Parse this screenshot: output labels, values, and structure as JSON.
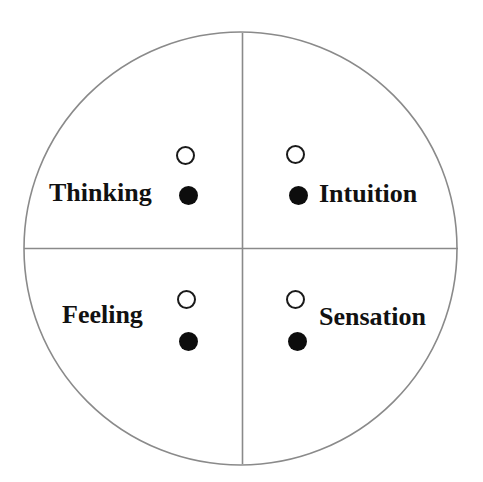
{
  "diagram": {
    "canvas": {
      "width": 483,
      "height": 482,
      "background": "#ffffff"
    },
    "outer_circle": {
      "name": "psyche-circle",
      "center_x": 240.5,
      "center_y": 248.5,
      "radius": 216.5,
      "stroke_color": "#8a8a8a",
      "stroke_width": 1.6,
      "fill": "none"
    },
    "dividers": {
      "vertical": {
        "name": "vertical-axis",
        "x": 242.5,
        "y1": 33,
        "y2": 464,
        "stroke_color": "#8a8a8a",
        "stroke_width": 1.6
      },
      "horizontal": {
        "name": "horizontal-axis",
        "y": 248.5,
        "x1": 24,
        "x2": 458,
        "stroke_color": "#8a8a8a",
        "stroke_width": 1.6
      }
    },
    "quadrants": [
      {
        "id": "thinking",
        "label": "Thinking",
        "position": "upper-left",
        "label_side": "left",
        "markers": [
          {
            "style": "open",
            "name": "thinking-open-circle"
          },
          {
            "style": "filled",
            "name": "thinking-filled-circle"
          }
        ]
      },
      {
        "id": "intuition",
        "label": "Intuition",
        "position": "upper-right",
        "label_side": "right",
        "markers": [
          {
            "style": "open",
            "name": "intuition-open-circle"
          },
          {
            "style": "filled",
            "name": "intuition-filled-circle"
          }
        ]
      },
      {
        "id": "feeling",
        "label": "Feeling",
        "position": "lower-left",
        "label_side": "left",
        "markers": [
          {
            "style": "open",
            "name": "feeling-open-circle"
          },
          {
            "style": "filled",
            "name": "feeling-filled-circle"
          }
        ]
      },
      {
        "id": "sensation",
        "label": "Sensation",
        "position": "lower-right",
        "label_side": "right",
        "markers": [
          {
            "style": "open",
            "name": "sensation-open-circle"
          },
          {
            "style": "filled",
            "name": "sensation-filled-circle"
          }
        ]
      }
    ],
    "marker_colors": {
      "open_stroke": "#1a1a1a",
      "filled_fill": "#0d0d0d"
    },
    "text_color": "#111111"
  }
}
